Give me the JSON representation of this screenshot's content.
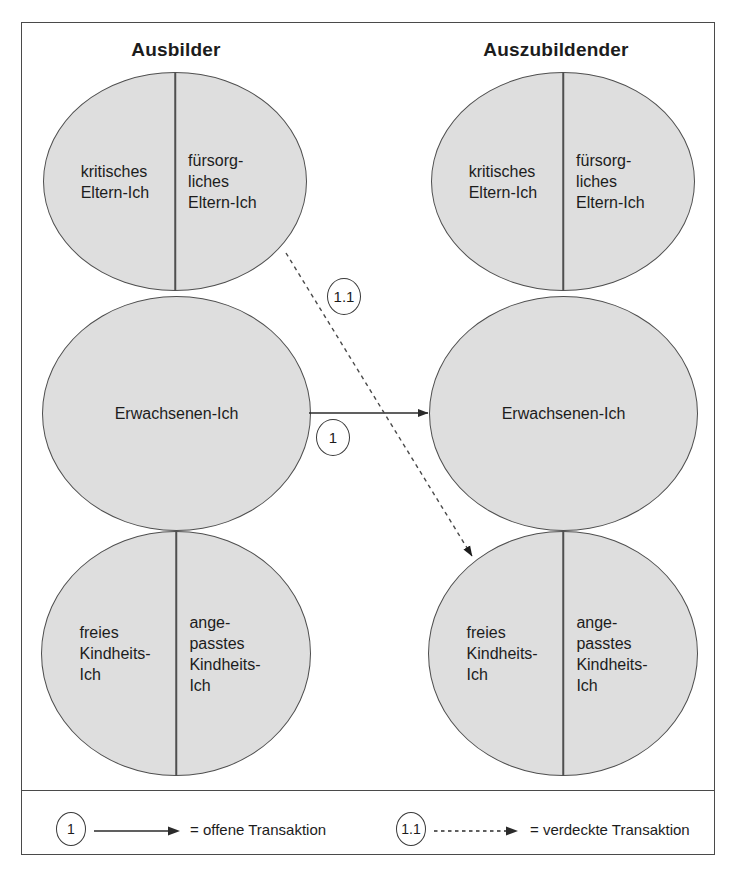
{
  "frame": {
    "border_color": "#4a4a4a"
  },
  "colors": {
    "ego_fill": "#dedede",
    "ego_stroke": "#4f4f4f",
    "text": "#1c1c1c",
    "arrow": "#2b2b2b"
  },
  "columns": [
    {
      "title": "Ausbilder"
    },
    {
      "title": "Auszubildender"
    }
  ],
  "ego_states": {
    "parent": {
      "left_label": "kritisches\nEltern-Ich",
      "right_label": "fürsorg-\nliches\nEltern-Ich",
      "divided": true
    },
    "adult": {
      "label": "Erwachsenen-Ich",
      "divided": false
    },
    "child": {
      "left_label": "freies\nKindheits-\nIch",
      "right_label": "ange-\npasstes\nKindheits-\nIch",
      "divided": true
    }
  },
  "transactions": [
    {
      "id": "1",
      "badge": "1",
      "style": "solid",
      "from": "Ausbilder Erwachsenen-Ich",
      "to": "Auszubildender Erwachsenen-Ich"
    },
    {
      "id": "1.1",
      "badge": "1.1",
      "style": "dotted",
      "from": "Ausbilder fürsorgliches Eltern-Ich",
      "to": "Auszubildender freies Kindheits-Ich"
    }
  ],
  "legend": [
    {
      "badge": "1",
      "style": "solid",
      "text": "= offene Transaktion"
    },
    {
      "badge": "1.1",
      "style": "dotted",
      "text": "= verdeckte Transaktion"
    }
  ]
}
